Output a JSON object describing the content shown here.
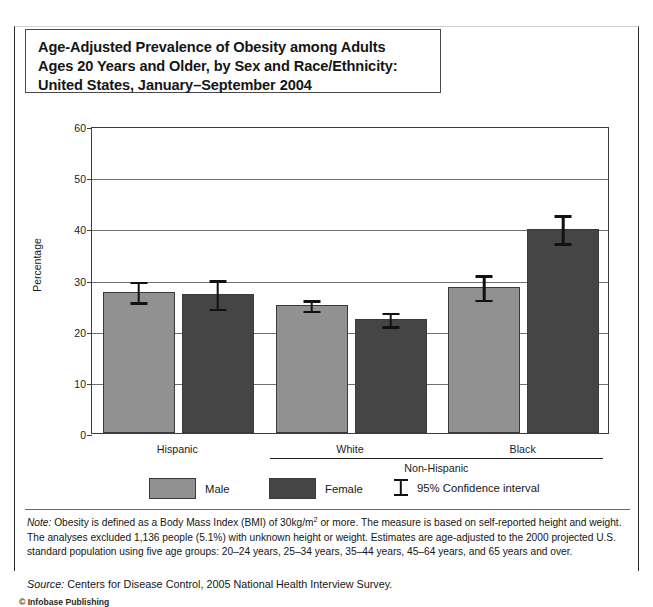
{
  "title": "Age-Adjusted Prevalence of Obesity among Adults\nAges 20 Years and Older, by Sex and Race/Ethnicity:\nUnited States, January–September 2004",
  "axis": {
    "ylabel": "Percentage",
    "yticks": [
      "0",
      "10",
      "20",
      "30",
      "40",
      "50",
      "60"
    ]
  },
  "groups": {
    "hispanic": "Hispanic",
    "white": "White",
    "black": "Black",
    "nonhispanic": "Non-Hispanic"
  },
  "legend": {
    "male": "Male",
    "female": "Female",
    "ci": "95% Confidence interval"
  },
  "colors": {
    "male": "#919191",
    "female": "#454545",
    "error": "#111111",
    "grid": "#6f6f6f",
    "axis": "#3d3d3d"
  },
  "notes": {
    "lead": "Note:",
    "body_1": " Obesity is defined as a Body Mass Index (BMI) of 30kg/m",
    "sup": "2",
    "body_2": " or more. The measure is based on self-reported height and weight. The analyses excluded 1,136 people (5.1%) with unknown height or weight.  Estimates are age-adjusted to the 2000 projected U.S. standard population using five age groups: 20–24 years, 25–34 years, 35–44 years, 45–64 years, and 65 years and over."
  },
  "source": {
    "lead": "Source:",
    "text": " Centers for Disease Control, 2005 National Health Interview Survey."
  },
  "copyright": "© Infobase Publishing",
  "chart_data": {
    "type": "bar",
    "title": "Age-Adjusted Prevalence of Obesity among Adults Ages 20 Years and Older, by Sex and Race/Ethnicity: United States, January–September 2004",
    "xlabel": "",
    "ylabel": "Percentage",
    "ylim": [
      0,
      60
    ],
    "ytick_step": 10,
    "grid": true,
    "legend_position": "bottom",
    "categories": [
      "Hispanic",
      "White",
      "Black"
    ],
    "category_supergroups": [
      "",
      "Non-Hispanic",
      "Non-Hispanic"
    ],
    "series": [
      {
        "name": "Male",
        "color": "#919191",
        "values": [
          27.5,
          25.0,
          28.5
        ],
        "ci_low": [
          25.4,
          23.8,
          25.9
        ],
        "ci_high": [
          30.0,
          26.4,
          31.2
        ]
      },
      {
        "name": "Female",
        "color": "#454545",
        "values": [
          27.2,
          22.3,
          39.8
        ],
        "ci_low": [
          24.2,
          20.8,
          37.0
        ],
        "ci_high": [
          30.2,
          23.9,
          42.9
        ]
      }
    ],
    "error_bar_label": "95% Confidence interval"
  }
}
